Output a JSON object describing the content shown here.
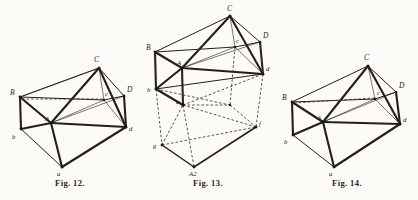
{
  "page": {
    "background_color": "#fcfbf8",
    "ink_color": "#231f1c",
    "kind": "engraved-plate",
    "figure_count": 3
  },
  "figures": [
    {
      "id": "fig-12",
      "caption": "Fig. 12.",
      "subject": "triangular prism in oblique projection with internal diagonals and projected base",
      "vertices": [
        {
          "label": "C",
          "case": "upper",
          "x": 99,
          "y": 66
        },
        {
          "label": "B",
          "case": "upper",
          "x": 20,
          "y": 97
        },
        {
          "label": "D",
          "case": "upper",
          "x": 124,
          "y": 96
        },
        {
          "label": "c",
          "case": "lower",
          "x": 104,
          "y": 99
        },
        {
          "label": "d",
          "case": "lower",
          "x": 126,
          "y": 128
        },
        {
          "label": "b",
          "case": "lower",
          "x": 21,
          "y": 130
        },
        {
          "label": "A",
          "case": "upper",
          "x": 51,
          "y": 121
        },
        {
          "label": "a",
          "case": "lower",
          "x": 62,
          "y": 168
        }
      ]
    },
    {
      "id": "fig-13",
      "caption": "Fig. 13.",
      "subject": "stacked double triangular prism with dashed projection lines to lower base",
      "vertices": [
        {
          "label": "C",
          "case": "upper",
          "x": 92,
          "y": 14
        },
        {
          "label": "D",
          "case": "upper",
          "x": 122,
          "y": 40
        },
        {
          "label": "B",
          "case": "upper",
          "x": 17,
          "y": 50
        },
        {
          "label": "c",
          "case": "lower",
          "x": 97,
          "y": 46
        },
        {
          "label": "d",
          "case": "lower",
          "x": 125,
          "y": 73
        },
        {
          "label": "b",
          "case": "lower",
          "x": 18,
          "y": 89
        },
        {
          "label": "A",
          "case": "upper",
          "x": 44,
          "y": 66
        },
        {
          "label": "a",
          "case": "lower",
          "x": 45,
          "y": 105
        },
        {
          "label": "f",
          "case": "lower",
          "x": 118,
          "y": 127
        },
        {
          "label": "g",
          "case": "lower",
          "x": 24,
          "y": 145
        },
        {
          "label": "A2",
          "case": "upper",
          "x": 56,
          "y": 168
        }
      ]
    },
    {
      "id": "fig-14",
      "caption": "Fig. 14.",
      "subject": "triangular prism in oblique projection with internal diagonals and projected base",
      "vertices": [
        {
          "label": "C",
          "case": "upper",
          "x": 92,
          "y": 64
        },
        {
          "label": "B",
          "case": "upper",
          "x": 14,
          "y": 102
        },
        {
          "label": "D",
          "case": "upper",
          "x": 120,
          "y": 91
        },
        {
          "label": "c",
          "case": "lower",
          "x": 99,
          "y": 98
        },
        {
          "label": "d",
          "case": "lower",
          "x": 124,
          "y": 124
        },
        {
          "label": "b",
          "case": "lower",
          "x": 16,
          "y": 136
        },
        {
          "label": "A",
          "case": "upper",
          "x": 47,
          "y": 121
        },
        {
          "label": "a",
          "case": "lower",
          "x": 58,
          "y": 168
        }
      ]
    }
  ]
}
